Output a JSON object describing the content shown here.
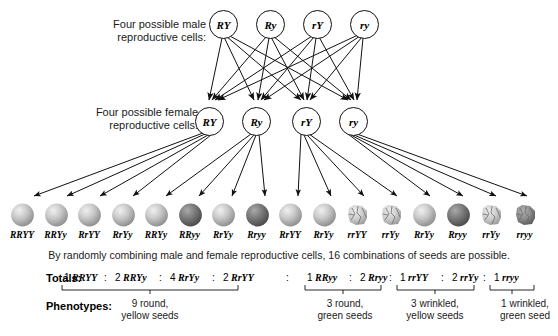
{
  "figure": {
    "male_label_line1": "Four possible male",
    "male_label_line2": "reproductive cells:",
    "female_label_line1": "Four possible female",
    "female_label_line2": "reproductive cells:",
    "caption": "By randomly combining male and female reproductive cells, 16 combinations of seeds are possible.",
    "totals_label": "Totals:",
    "phenotypes_label": "Phenotypes:"
  },
  "male_gametes": [
    {
      "label": "RY"
    },
    {
      "label": "Ry"
    },
    {
      "label": "rY"
    },
    {
      "label": "ry"
    }
  ],
  "female_gametes": [
    {
      "label": "RY"
    },
    {
      "label": "Ry"
    },
    {
      "label": "rY"
    },
    {
      "label": "ry"
    }
  ],
  "seeds": [
    {
      "genotype": "RRYY",
      "shape": "round",
      "color": "yellow"
    },
    {
      "genotype": "RRYy",
      "shape": "round",
      "color": "yellow"
    },
    {
      "genotype": "RrYY",
      "shape": "round",
      "color": "yellow"
    },
    {
      "genotype": "RrYy",
      "shape": "round",
      "color": "yellow"
    },
    {
      "genotype": "RRYy",
      "shape": "round",
      "color": "yellow"
    },
    {
      "genotype": "RRyy",
      "shape": "round",
      "color": "green"
    },
    {
      "genotype": "RrYy",
      "shape": "round",
      "color": "yellow"
    },
    {
      "genotype": "Rryy",
      "shape": "round",
      "color": "green"
    },
    {
      "genotype": "RrYY",
      "shape": "round",
      "color": "yellow"
    },
    {
      "genotype": "RrYy",
      "shape": "round",
      "color": "yellow"
    },
    {
      "genotype": "rrYY",
      "shape": "wrinkled",
      "color": "yellow"
    },
    {
      "genotype": "rrYy",
      "shape": "wrinkled",
      "color": "yellow"
    },
    {
      "genotype": "RrYy",
      "shape": "round",
      "color": "yellow"
    },
    {
      "genotype": "Rryy",
      "shape": "round",
      "color": "green"
    },
    {
      "genotype": "rrYy",
      "shape": "wrinkled",
      "color": "yellow"
    },
    {
      "genotype": "rryy",
      "shape": "wrinkled",
      "color": "green"
    }
  ],
  "totals": [
    {
      "count": "1",
      "genotype": "RRYY",
      "group": 0
    },
    {
      "count": "2",
      "genotype": "RRYy",
      "group": 0
    },
    {
      "count": "4",
      "genotype": "RrYy",
      "group": 0
    },
    {
      "count": "2",
      "genotype": "RrYY",
      "group": 0
    },
    {
      "count": "1",
      "genotype": "RRyy",
      "group": 1
    },
    {
      "count": "2",
      "genotype": "Rryy",
      "group": 1
    },
    {
      "count": "1",
      "genotype": "rrYY",
      "group": 2
    },
    {
      "count": "2",
      "genotype": "rrYy",
      "group": 2
    },
    {
      "count": "1",
      "genotype": "rryy",
      "group": 3
    }
  ],
  "phenotypes": [
    {
      "line1": "9 round,",
      "line2": "yellow seeds"
    },
    {
      "line1": "3 round,",
      "line2": "green seeds"
    },
    {
      "line1": "3 wrinkled,",
      "line2": "yellow seeds"
    },
    {
      "line1": "1 wrinkled,",
      "line2": "green seed"
    }
  ],
  "colors": {
    "yellow_seed": "#b6b6b6",
    "green_seed": "#6d6d6d",
    "line": "#111111",
    "text": "#1a1a1a"
  }
}
